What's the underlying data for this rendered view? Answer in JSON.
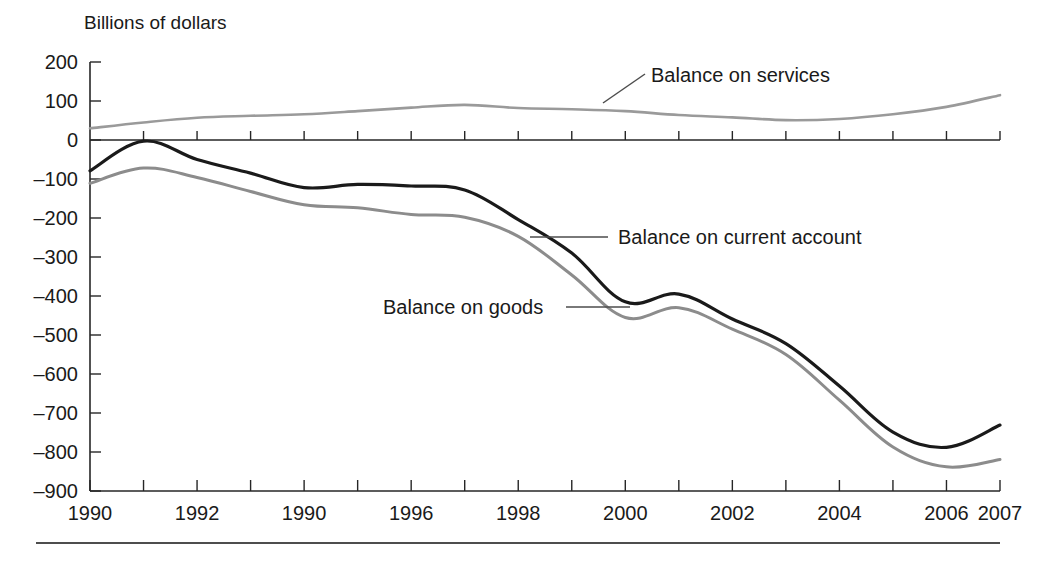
{
  "chart_data": {
    "type": "line",
    "title": "",
    "ylabel": "Billions of dollars",
    "xlabel": "",
    "ylim": [
      -900,
      200
    ],
    "xlim": [
      1990,
      2007
    ],
    "grid": false,
    "legend_position": "inline-annotations",
    "y_ticks": [
      200,
      100,
      0,
      -100,
      -200,
      -300,
      -400,
      -500,
      -600,
      -700,
      -800,
      -900
    ],
    "y_tick_labels": [
      "200",
      "100",
      "0",
      "–100",
      "–200",
      "–300",
      "–400",
      "–500",
      "–600",
      "–700",
      "–800",
      "–900"
    ],
    "x_ticks": [
      1990,
      1991,
      1992,
      1993,
      1994,
      1995,
      1996,
      1997,
      1998,
      1999,
      2000,
      2001,
      2002,
      2003,
      2004,
      2005,
      2006,
      2007
    ],
    "x_tick_labels": [
      {
        "x": 1990,
        "label": "1990"
      },
      {
        "x": 1992,
        "label": "1992"
      },
      {
        "x": 1994,
        "label": "1990"
      },
      {
        "x": 1996,
        "label": "1996"
      },
      {
        "x": 1998,
        "label": "1998"
      },
      {
        "x": 2000,
        "label": "2000"
      },
      {
        "x": 2002,
        "label": "2002"
      },
      {
        "x": 2004,
        "label": "2004"
      },
      {
        "x": 2006,
        "label": "2006"
      },
      {
        "x": 2007,
        "label": "2007"
      }
    ],
    "x": [
      1990,
      1991,
      1992,
      1993,
      1994,
      1995,
      1996,
      1997,
      1998,
      1999,
      2000,
      2001,
      2002,
      2003,
      2004,
      2005,
      2006,
      2007
    ],
    "series": [
      {
        "name": "Balance on services",
        "color": "#9a9a9a",
        "width": 2.6,
        "values": [
          30,
          45,
          57,
          62,
          66,
          74,
          83,
          90,
          82,
          79,
          74,
          64,
          58,
          51,
          54,
          66,
          85,
          115
        ]
      },
      {
        "name": "Balance on current account",
        "color": "#1a1a1a",
        "width": 3.2,
        "values": [
          -79,
          -3,
          -50,
          -85,
          -122,
          -114,
          -118,
          -128,
          -204,
          -290,
          -415,
          -395,
          -459,
          -522,
          -631,
          -749,
          -788,
          -731
        ]
      },
      {
        "name": "Balance on goods",
        "color": "#8c8c8c",
        "width": 3.0,
        "values": [
          -111,
          -72,
          -96,
          -132,
          -166,
          -174,
          -191,
          -198,
          -247,
          -346,
          -455,
          -430,
          -485,
          -550,
          -667,
          -787,
          -838,
          -819
        ]
      }
    ],
    "annotations": [
      {
        "name": "balance-on-services",
        "text": "Balance on services",
        "text_x": 651,
        "text_y": 82,
        "leader": {
          "x1": 645,
          "y1": 74,
          "x2": 603,
          "y2": 103
        },
        "color": "#4d4d4d"
      },
      {
        "name": "balance-on-current-account",
        "text": "Balance on current account",
        "text_x": 618,
        "text_y": 244,
        "leader": {
          "x1": 530,
          "y1": 237,
          "x2": 608,
          "y2": 237
        },
        "color": "#4d4d4d"
      },
      {
        "name": "balance-on-goods",
        "text": "Balance on goods",
        "text_x": 383,
        "text_y": 314,
        "leader": {
          "x1": 566,
          "y1": 307,
          "x2": 630,
          "y2": 307
        },
        "color": "#4d4d4d"
      }
    ]
  },
  "figure": {
    "footer_rule": true
  }
}
